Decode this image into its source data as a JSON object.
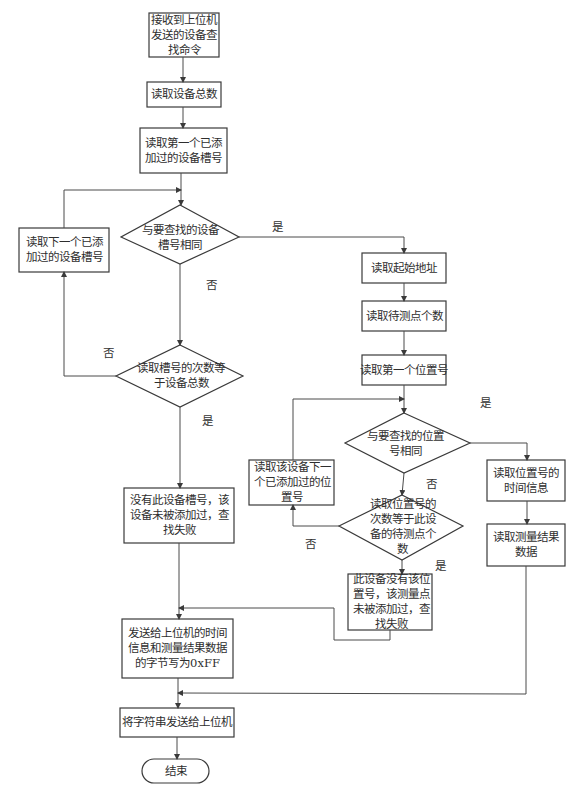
{
  "diagram": {
    "type": "flowchart",
    "nodes": {
      "start": "接收到上位机发送的设备查找命令",
      "read_total": "读取设备总数",
      "read_first_slot": "读取第一个已添加过的设备槽号",
      "cond_slot_match": "与要查找的设备槽号相同",
      "read_next_slot": "读取下一个已添加过的设备槽号",
      "cond_slot_count": "读取槽号的次数等于设备总数",
      "no_device": "没有此设备槽号，该设备未被添加过，查找失败",
      "read_start_addr": "读取起始地址",
      "read_point_count": "读取待测点个数",
      "read_first_pos": "读取第一个位置号",
      "cond_pos_match": "与要查找的位置号相同",
      "read_next_pos": "读取该设备下一个已添加过的位置号",
      "cond_pos_count": "读取位置号的次数等于此设备的待测点个数",
      "no_position": "此设备没有该位置号，该测量点未被添加过，查找失败",
      "read_time": "读取位置号的时间信息",
      "read_result": "读取测量结果数据",
      "write_ff": "发送给上位机的时间信息和测量结果数据的字节写为0xFF",
      "send_string": "将字符串发送给上位机",
      "end": "结束"
    },
    "edge_labels": {
      "slot_match_yes": "是",
      "slot_match_no": "否",
      "slot_count_no": "否",
      "slot_count_yes": "是",
      "pos_match_yes": "是",
      "pos_match_no": "否",
      "pos_count_no": "否",
      "pos_count_yes": "是"
    }
  }
}
